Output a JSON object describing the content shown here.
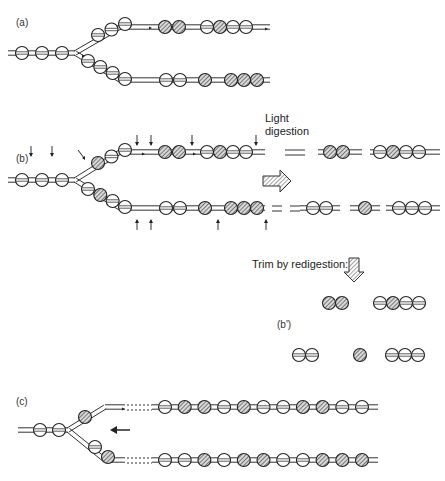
{
  "panels": {
    "a": {
      "label": "(a)"
    },
    "b": {
      "label": "(b)"
    },
    "b_prime": {
      "label": "(b')"
    },
    "c": {
      "label": "(c)"
    }
  },
  "annotations": {
    "light_digestion_line1": "Light",
    "light_digestion_line2": "digestion",
    "trim_by_redigestion": "Trim by redigestion:"
  },
  "legend": {
    "nucleosome_types": [
      "open",
      "hatched"
    ],
    "open_meaning": "parental nucleosome (unlabeled)",
    "hatched_meaning": "new nucleosome (labeled)"
  },
  "diagram": {
    "a": {
      "parental": [
        "open",
        "open",
        "open"
      ],
      "upper_fork": [
        "open",
        "open",
        "open"
      ],
      "upper_arm": [
        "hatched",
        "hatched",
        "gap",
        "open",
        "hatched",
        "open",
        "open"
      ],
      "lower_fork": [
        "open",
        "open",
        "open",
        "open"
      ],
      "lower_arm": [
        "open",
        "open",
        "gap",
        "hatched",
        "gap",
        "hatched",
        "hatched",
        "hatched"
      ]
    },
    "b": {
      "parental": [
        "open",
        "open",
        "open"
      ],
      "upper_fork": [
        "hatched",
        "open",
        "open"
      ],
      "upper_arm": [
        "hatched",
        "hatched",
        "gap",
        "open",
        "hatched",
        "open",
        "open"
      ],
      "lower_fork": [
        "open",
        "hatched",
        "open",
        "open"
      ],
      "lower_arm": [
        "open",
        "open",
        "gap",
        "hatched",
        "gap",
        "hatched",
        "hatched",
        "hatched"
      ],
      "digest_products_upper": [
        [
          "hatched",
          "hatched"
        ],
        [
          "open",
          "hatched",
          "open",
          "open"
        ]
      ],
      "digest_products_lower": [
        [
          "open",
          "open"
        ],
        [
          "hatched"
        ],
        [
          "open",
          "open",
          "open"
        ]
      ]
    },
    "b_prime": {
      "upper": [
        [
          "hatched",
          "hatched"
        ],
        [
          "open",
          "hatched",
          "open",
          "open"
        ]
      ],
      "lower": [
        [
          "open",
          "open"
        ],
        [
          "hatched"
        ],
        [
          "open",
          "open",
          "open"
        ]
      ]
    },
    "c": {
      "parental": [
        "open",
        "open"
      ],
      "upper_fork": [
        "hatched"
      ],
      "upper_arm": [
        "open",
        "hatched",
        "hatched",
        "open",
        "hatched",
        "open",
        "open",
        "hatched",
        "hatched",
        "open",
        "open"
      ],
      "lower_fork": [
        "open",
        "hatched"
      ],
      "lower_arm": [
        "open",
        "open",
        "hatched",
        "open",
        "hatched",
        "hatched",
        "open",
        "open",
        "hatched",
        "hatched",
        "hatched"
      ]
    }
  }
}
